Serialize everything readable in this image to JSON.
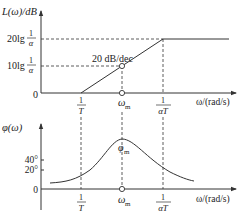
{
  "magnitude_plot": {
    "y_label": "L(ω)/dB",
    "y_ticks": [
      {
        "label_prefix": "20lg",
        "frac_num": "1",
        "frac_den": "α"
      },
      {
        "label_prefix": "10lg",
        "frac_num": "1",
        "frac_den": "α"
      }
    ],
    "origin_label": "0",
    "slope_label": "20 dB/dec",
    "x_label": "ω/(rad/s)",
    "x_ticks": [
      {
        "frac_num": "1",
        "frac_den": "T"
      },
      {
        "label": "ω",
        "sub": "m"
      },
      {
        "frac_num": "1",
        "frac_den": "αT"
      }
    ]
  },
  "phase_plot": {
    "y_label": "φ(ω)",
    "y_ticks": [
      "40°",
      "20°",
      "0"
    ],
    "peak_label": "φ",
    "peak_sub": "m",
    "x_label": "ω/(rad/s)",
    "x_ticks": [
      {
        "frac_num": "1",
        "frac_den": "T"
      },
      {
        "label": "ω",
        "sub": "m"
      },
      {
        "frac_num": "1",
        "frac_den": "αT"
      }
    ]
  }
}
